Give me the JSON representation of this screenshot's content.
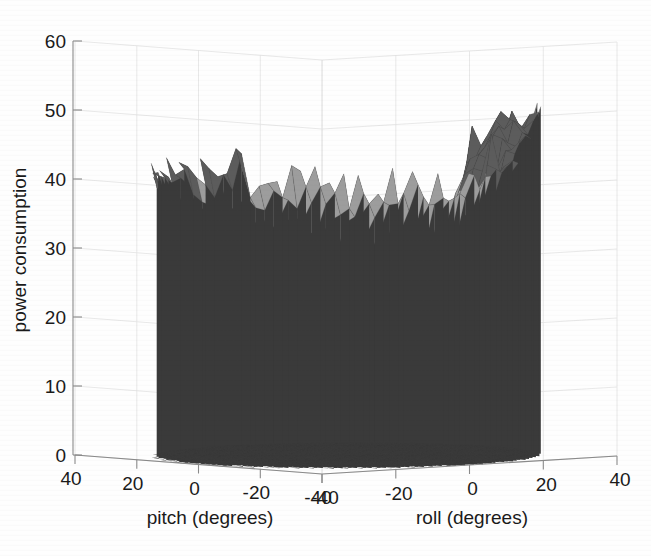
{
  "figure": {
    "background_color": "#fefefe",
    "text_color": "#1a1a1a",
    "axis_color": "#8a8a8a"
  },
  "chart_data": {
    "type": "surface",
    "title": "",
    "xlabel": "pitch (degrees)",
    "ylabel": "roll (degrees)",
    "zlabel": "power consumption",
    "grid": true,
    "legend": "none",
    "projection": "3d-matlab-surf",
    "colormap": "gray",
    "xlim": [
      -40,
      40
    ],
    "ylim": [
      -40,
      40
    ],
    "zlim": [
      0,
      60
    ],
    "x_ticks": [
      40,
      20,
      0,
      -20,
      -40
    ],
    "x_tick_labels": [
      "40",
      "20",
      "0",
      "-20",
      "-40"
    ],
    "y_ticks": [
      -40,
      -20,
      0,
      20,
      40
    ],
    "y_tick_labels": [
      "-40",
      "-20",
      "0",
      "20",
      "40"
    ],
    "z_ticks": [
      0,
      10,
      20,
      30,
      40,
      50,
      60
    ],
    "z_tick_labels": [
      "0",
      "10",
      "20",
      "30",
      "40",
      "50",
      "60"
    ],
    "surface_bands": [
      {
        "name": "peak-dark",
        "z_range": [
          38,
          50
        ],
        "color": "#5c5c5c"
      },
      {
        "name": "upper-light",
        "z_range": [
          26,
          38
        ],
        "color": "#b9b9b9"
      },
      {
        "name": "mid-light",
        "z_range": [
          20,
          30
        ],
        "color": "#a8a8a8"
      },
      {
        "name": "mid-gray",
        "z_range": [
          14,
          22
        ],
        "color": "#8c8c8c"
      },
      {
        "name": "lower-gray",
        "z_range": [
          8,
          16
        ],
        "color": "#6e6e6e"
      },
      {
        "name": "base-dark",
        "z_range": [
          0,
          9
        ],
        "color": "#3a3a3a"
      }
    ],
    "z_peak_left": 40,
    "z_peak_right": 50,
    "z_valley_floor": 2,
    "mesh_line_color": "#4a4a4a",
    "x_samples": 46,
    "y_samples": 34,
    "seed": 20240117
  },
  "geometry": {
    "origin_x": 322,
    "origin_y": 474,
    "left_end_x": 75,
    "left_end_y": 455,
    "right_end_x": 617,
    "right_end_y": 456,
    "z_axis_x": 73,
    "z_top_y": 41,
    "z_zero_y": 455,
    "px_per_unit_z": 6.9
  }
}
